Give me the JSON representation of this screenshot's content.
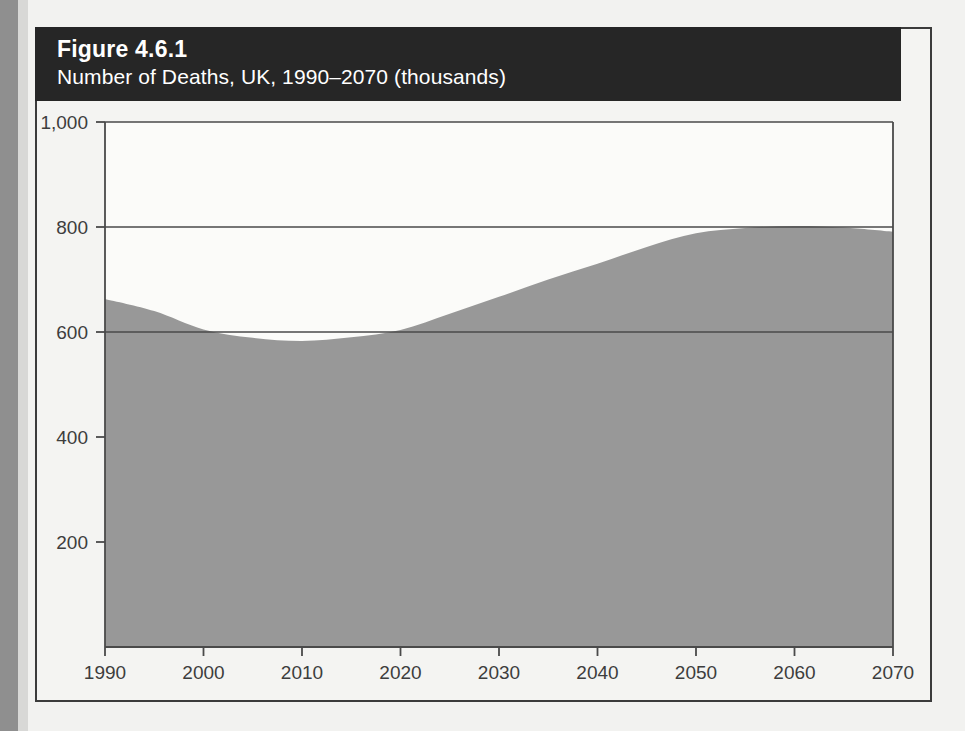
{
  "figure": {
    "number": "Figure 4.6.1",
    "subtitle": "Number of Deaths, UK, 1990–2070 (thousands)"
  },
  "colors": {
    "banner_background": "#262626",
    "banner_text": "#ffffff",
    "area_fill": "#989898",
    "axis_line": "#4a4a4a",
    "gridline": "#4a4a4a",
    "page_background": "#f2f2f0",
    "plot_background": "#fbfbf9",
    "tick_label": "#3d3d3d"
  },
  "chart_data": {
    "type": "area",
    "title": "Figure 4.6.1",
    "subtitle": "Number of Deaths, UK, 1990–2070 (thousands)",
    "xlabel": "",
    "ylabel": "",
    "units": "thousands",
    "xlim": [
      1990,
      2070
    ],
    "ylim": [
      0,
      1000
    ],
    "grid": true,
    "gridlines_y": [
      600,
      800,
      1000
    ],
    "legend": "none",
    "xticks": [
      1990,
      2000,
      2010,
      2020,
      2030,
      2040,
      2050,
      2060,
      2070
    ],
    "xtick_labels": [
      "1990",
      "2000",
      "2010",
      "2020",
      "2030",
      "2040",
      "2050",
      "2060",
      "2070"
    ],
    "yticks": [
      200,
      400,
      600,
      800,
      1000
    ],
    "ytick_labels": [
      "200",
      "400",
      "600",
      "800",
      "1,000"
    ],
    "series": [
      {
        "name": "Number of deaths (thousands)",
        "x": [
          1990,
          1995,
          2000,
          2005,
          2010,
          2015,
          2020,
          2025,
          2030,
          2035,
          2040,
          2045,
          2050,
          2055,
          2060,
          2065,
          2070
        ],
        "values": [
          663,
          640,
          605,
          589,
          583,
          590,
          604,
          635,
          667,
          700,
          730,
          762,
          788,
          798,
          802,
          799,
          791
        ]
      }
    ]
  }
}
